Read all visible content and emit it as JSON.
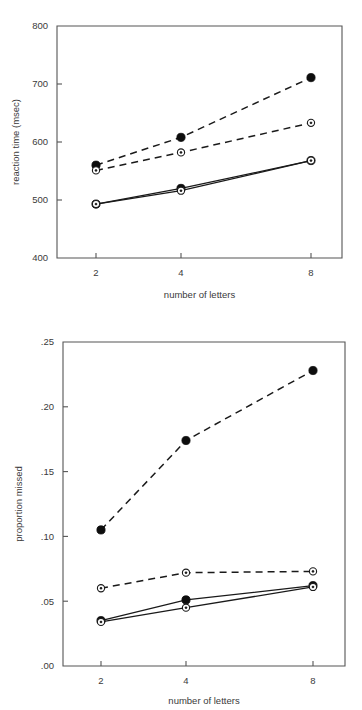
{
  "page": {
    "background": "#ffffff",
    "ink": "#1a1a1a"
  },
  "figures": [
    {
      "id": "reaction-time",
      "name": "reaction-time-chart"
    },
    {
      "id": "proportion-missed",
      "name": "proportion-missed-chart"
    }
  ],
  "chart_data": [
    {
      "type": "line",
      "title": "",
      "xlabel": "number of letters",
      "ylabel": "reaction time (msec)",
      "categories": [
        "2",
        "4",
        "8"
      ],
      "x": [
        2,
        4,
        8
      ],
      "xtick_labels": [
        "2",
        "4",
        "8"
      ],
      "ytick_labels": [
        "400",
        "500",
        "600",
        "700",
        "800"
      ],
      "yticks": [
        400,
        500,
        600,
        700,
        800
      ],
      "ylim": [
        400,
        800
      ],
      "grid": false,
      "legend": "none",
      "series": [
        {
          "name": "dashed-filled",
          "marker": "filled-circle",
          "line_style": "dashed",
          "values": [
            560,
            608,
            711
          ]
        },
        {
          "name": "dashed-open",
          "marker": "open-circle",
          "line_style": "dashed",
          "values": [
            551,
            582,
            633
          ]
        },
        {
          "name": "solid-filled",
          "marker": "filled-circle",
          "line_style": "solid",
          "values": [
            493,
            520,
            568
          ]
        },
        {
          "name": "solid-open",
          "marker": "open-circle",
          "line_style": "solid",
          "values": [
            493,
            516,
            568
          ]
        }
      ]
    },
    {
      "type": "line",
      "title": "",
      "xlabel": "number of letters",
      "ylabel": "proportion missed",
      "categories": [
        "2",
        "4",
        "8"
      ],
      "x": [
        2,
        4,
        8
      ],
      "xtick_labels": [
        "2",
        "4",
        "8"
      ],
      "ytick_labels": [
        ".00",
        ".05",
        ".10",
        ".15",
        ".20",
        ".25"
      ],
      "yticks": [
        0.0,
        0.05,
        0.1,
        0.15,
        0.2,
        0.25
      ],
      "ylim": [
        0.0,
        0.25
      ],
      "grid": false,
      "legend": "none",
      "series": [
        {
          "name": "dashed-filled",
          "marker": "filled-circle",
          "line_style": "dashed",
          "values": [
            0.105,
            0.174,
            0.228
          ]
        },
        {
          "name": "dashed-open",
          "marker": "open-circle",
          "line_style": "dashed",
          "values": [
            0.06,
            0.072,
            0.073
          ]
        },
        {
          "name": "solid-filled",
          "marker": "filled-circle",
          "line_style": "solid",
          "values": [
            0.035,
            0.051,
            0.062
          ]
        },
        {
          "name": "solid-open",
          "marker": "open-circle",
          "line_style": "solid",
          "values": [
            0.034,
            0.045,
            0.061
          ]
        }
      ]
    }
  ]
}
